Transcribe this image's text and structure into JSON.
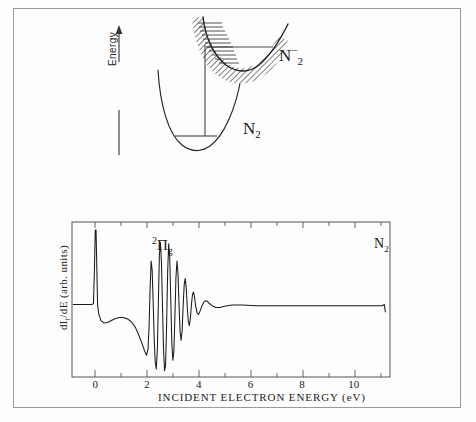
{
  "figure": {
    "title_visible": false,
    "background_color": "#fdfdfd",
    "border_color": "#9a9a9a",
    "line_color": "#1a1a1a"
  },
  "panel_top": {
    "name": "potential-energy-curves",
    "energy_axis_label": "Energy",
    "energy_axis_arrow": "up-arrow",
    "curves": [
      {
        "id": "n2-anion",
        "label_main": "N",
        "label_sub": "2",
        "label_sup": "−",
        "label_text": "N2-",
        "hatched": true,
        "description": "resonance potential curve with hatched width band and vibrational level ticks"
      },
      {
        "id": "n2-neutral",
        "label_main": "N",
        "label_sub": "2",
        "label_sup": "",
        "label_text": "N2",
        "hatched": false,
        "description": "ground state potential curve with v=0 level line"
      }
    ],
    "transition_arrow": "vertical-transition-line"
  },
  "panel_bottom": {
    "name": "electron-transmission-spectrum",
    "species_label_main": "N",
    "species_label_sub": "2",
    "species_label_text": "N2",
    "resonance_label_sup": "2",
    "resonance_label_main": "Π",
    "resonance_label_sub": "g",
    "resonance_label_text": "2Πg"
  },
  "chart_data": {
    "type": "line",
    "title": "",
    "xlabel": "INCIDENT ELECTRON ENERGY (eV)",
    "ylabel": "dIₜ/dE (arb. units)",
    "xlabel_parts": {
      "text": "INCIDENT ELECTRON ENERGY (eV)"
    },
    "ylabel_parts": {
      "prefix": "dI",
      "subscript": "t",
      "suffix": "/dE (arb. units)"
    },
    "xlim": [
      -0.9,
      11.4
    ],
    "ylim": [
      -1.15,
      1.35
    ],
    "grid": false,
    "legend": "none",
    "xticks_major": [
      0,
      2,
      4,
      6,
      8,
      10
    ],
    "xtick_labels": [
      "0",
      "2",
      "4",
      "6",
      "8",
      "10"
    ],
    "xticks_minor": [
      1,
      3,
      5,
      7,
      9,
      11
    ],
    "yticks": [],
    "annotations": [
      {
        "text": "2Πg",
        "x": 2.15,
        "y": 1.0,
        "role": "resonance-assignment"
      },
      {
        "text": "N2",
        "x": 10.8,
        "y": 1.1,
        "role": "species-label"
      }
    ],
    "series": [
      {
        "name": "dI_t/dE transmitted current derivative",
        "description": "Sharp zero-energy spike, broad negative dip near 1.2 eV, damped oscillatory 2-Pi-g resonance structure from 2.0 to 3.6 eV, flat baseline beyond 4 eV ending in a small terminal tick at 11.2 eV",
        "points": [
          [
            -0.85,
            0.02
          ],
          [
            -0.55,
            0.02
          ],
          [
            -0.3,
            0.02
          ],
          [
            -0.14,
            0.02
          ],
          [
            -0.07,
            0.03
          ],
          [
            -0.03,
            0.62
          ],
          [
            0.0,
            1.22
          ],
          [
            0.03,
            1.22
          ],
          [
            0.06,
            0.6
          ],
          [
            0.09,
            0.0
          ],
          [
            0.14,
            -0.14
          ],
          [
            0.22,
            -0.24
          ],
          [
            0.34,
            -0.28
          ],
          [
            0.48,
            -0.27
          ],
          [
            0.62,
            -0.24
          ],
          [
            0.76,
            -0.21
          ],
          [
            0.92,
            -0.19
          ],
          [
            1.08,
            -0.19
          ],
          [
            1.24,
            -0.21
          ],
          [
            1.4,
            -0.26
          ],
          [
            1.55,
            -0.35
          ],
          [
            1.68,
            -0.47
          ],
          [
            1.8,
            -0.6
          ],
          [
            1.9,
            -0.72
          ],
          [
            1.98,
            -0.8
          ],
          [
            2.04,
            -0.7
          ],
          [
            2.08,
            -0.35
          ],
          [
            2.12,
            0.25
          ],
          [
            2.16,
            0.72
          ],
          [
            2.2,
            0.58
          ],
          [
            2.24,
            0.05
          ],
          [
            2.28,
            -0.55
          ],
          [
            2.32,
            -0.92
          ],
          [
            2.36,
            -1.02
          ],
          [
            2.4,
            -0.72
          ],
          [
            2.44,
            0.05
          ],
          [
            2.48,
            0.82
          ],
          [
            2.52,
            1.02
          ],
          [
            2.56,
            0.7
          ],
          [
            2.6,
            0.0
          ],
          [
            2.64,
            -0.7
          ],
          [
            2.68,
            -1.05
          ],
          [
            2.72,
            -0.95
          ],
          [
            2.76,
            -0.3
          ],
          [
            2.8,
            0.55
          ],
          [
            2.84,
            1.0
          ],
          [
            2.88,
            0.78
          ],
          [
            2.92,
            0.1
          ],
          [
            2.96,
            -0.58
          ],
          [
            3.0,
            -0.88
          ],
          [
            3.04,
            -0.74
          ],
          [
            3.08,
            -0.18
          ],
          [
            3.12,
            0.45
          ],
          [
            3.16,
            0.72
          ],
          [
            3.2,
            0.52
          ],
          [
            3.24,
            0.02
          ],
          [
            3.28,
            -0.42
          ],
          [
            3.32,
            -0.56
          ],
          [
            3.36,
            -0.4
          ],
          [
            3.4,
            0.0
          ],
          [
            3.44,
            0.34
          ],
          [
            3.48,
            0.44
          ],
          [
            3.52,
            0.28
          ],
          [
            3.56,
            -0.04
          ],
          [
            3.6,
            -0.26
          ],
          [
            3.64,
            -0.32
          ],
          [
            3.68,
            -0.2
          ],
          [
            3.72,
            0.02
          ],
          [
            3.76,
            0.18
          ],
          [
            3.8,
            0.22
          ],
          [
            3.84,
            0.14
          ],
          [
            3.88,
            0.0
          ],
          [
            3.94,
            -0.12
          ],
          [
            4.0,
            -0.14
          ],
          [
            4.06,
            -0.08
          ],
          [
            4.14,
            0.01
          ],
          [
            4.22,
            0.07
          ],
          [
            4.3,
            0.08
          ],
          [
            4.4,
            0.04
          ],
          [
            4.52,
            0.0
          ],
          [
            4.66,
            -0.03
          ],
          [
            4.82,
            -0.03
          ],
          [
            5.0,
            -0.01
          ],
          [
            5.3,
            0.01
          ],
          [
            5.7,
            0.01
          ],
          [
            6.2,
            0.0
          ],
          [
            6.8,
            0.0
          ],
          [
            7.5,
            0.0
          ],
          [
            8.3,
            0.0
          ],
          [
            9.2,
            0.0
          ],
          [
            10.1,
            0.0
          ],
          [
            10.8,
            0.0
          ],
          [
            11.1,
            0.0
          ],
          [
            11.18,
            0.02
          ],
          [
            11.22,
            -0.1
          ]
        ]
      }
    ]
  }
}
